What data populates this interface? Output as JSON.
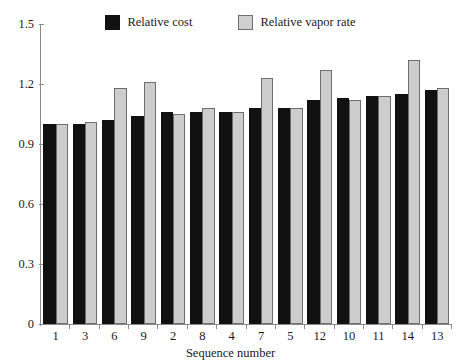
{
  "chart_data": {
    "type": "bar",
    "title": "",
    "xlabel": "Sequence number",
    "ylabel": "",
    "categories": [
      "1",
      "3",
      "6",
      "9",
      "2",
      "8",
      "4",
      "7",
      "5",
      "12",
      "10",
      "11",
      "14",
      "13"
    ],
    "series": [
      {
        "name": "Relative cost",
        "color": "#111111",
        "values": [
          1.0,
          1.0,
          1.02,
          1.04,
          1.06,
          1.06,
          1.06,
          1.08,
          1.08,
          1.12,
          1.13,
          1.14,
          1.15,
          1.17
        ]
      },
      {
        "name": "Relative vapor rate",
        "color": "#cdcdcd",
        "values": [
          1.0,
          1.01,
          1.18,
          1.21,
          1.05,
          1.08,
          1.06,
          1.23,
          1.08,
          1.27,
          1.12,
          1.14,
          1.32,
          1.18
        ]
      }
    ],
    "ylim": [
      0,
      1.5
    ],
    "yticks": [
      "0",
      "0.3",
      "0.6",
      "0.9",
      "1.2",
      "1.5"
    ],
    "ytick_values": [
      0,
      0.3,
      0.6,
      0.9,
      1.2,
      1.5
    ],
    "grid": false,
    "legend_position": "top-center"
  },
  "legend": {
    "entries": [
      {
        "label": "Relative cost",
        "swatch": "cost-swatch"
      },
      {
        "label": "Relative vapor rate",
        "swatch": "vapor-swatch"
      }
    ]
  },
  "axes": {
    "x_title": "Sequence number"
  }
}
